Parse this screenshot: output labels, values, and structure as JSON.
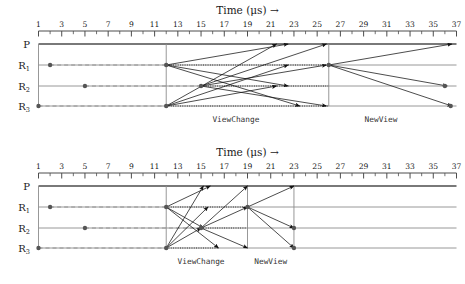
{
  "figure": {
    "axis_title": "Time (μs) →",
    "row_labels": [
      {
        "base": "P",
        "sub": ""
      },
      {
        "base": "R",
        "sub": "1"
      },
      {
        "base": "R",
        "sub": "2"
      },
      {
        "base": "R",
        "sub": "3"
      }
    ],
    "phase_labels": {
      "view_change": "ViewChange",
      "new_view": "NewView"
    },
    "colors": {
      "axis": "#4d4d4d",
      "lane": "#8c8c8c",
      "arrow": "#111111",
      "dot": "#555555",
      "dotted": "#222222",
      "text": "#1a1a1a"
    }
  },
  "chart_data": [
    {
      "type": "scatter",
      "id": "top",
      "title": "Time (μs) →",
      "xlabel": "Time (μs) →",
      "ylabel": "",
      "xlim": [
        1,
        37
      ],
      "tick_step": 1,
      "label_step": 2,
      "tick_labels": [
        1,
        3,
        5,
        7,
        9,
        11,
        13,
        15,
        17,
        19,
        21,
        23,
        25,
        27,
        29,
        31,
        33,
        35,
        37
      ],
      "lanes": [
        "P",
        "R1",
        "R2",
        "R3"
      ],
      "grid": false,
      "legend": "none",
      "annotations": [
        {
          "text": "ViewChange",
          "x": 18.0
        },
        {
          "text": "NewView",
          "x": 30.5
        }
      ],
      "events": [
        {
          "lane": "R1",
          "x": 2
        },
        {
          "lane": "R2",
          "x": 5
        },
        {
          "lane": "R3",
          "x": 1
        },
        {
          "lane": "R1",
          "x": 12
        },
        {
          "lane": "R3",
          "x": 12
        },
        {
          "lane": "R2",
          "x": 15
        },
        {
          "lane": "R1",
          "x": 26
        },
        {
          "lane": "R2",
          "x": 36
        },
        {
          "lane": "R3",
          "x": 36.5
        }
      ],
      "sync_lines": [
        {
          "x": 1,
          "from": "P",
          "to": "R3"
        },
        {
          "x": 12,
          "from": "P",
          "to": "R3"
        },
        {
          "x": 26,
          "from": "P",
          "to": "R3"
        }
      ],
      "messages": [
        {
          "from": "R1",
          "x0": 12,
          "to": "P",
          "x1": 22.5
        },
        {
          "from": "R1",
          "x0": 12,
          "to": "R2",
          "x1": 22.5
        },
        {
          "from": "R1",
          "x0": 12,
          "to": "R3",
          "x1": 23.5
        },
        {
          "from": "R3",
          "x0": 12,
          "to": "P",
          "x1": 21.5
        },
        {
          "from": "R3",
          "x0": 12,
          "to": "R1",
          "x1": 22.5
        },
        {
          "from": "R3",
          "x0": 12,
          "to": "R2",
          "x1": 21.5
        },
        {
          "from": "R2",
          "x0": 15,
          "to": "P",
          "x1": 25.8
        },
        {
          "from": "R2",
          "x0": 15,
          "to": "R1",
          "x1": 25.8
        },
        {
          "from": "R2",
          "x0": 15,
          "to": "R3",
          "x1": 25.8
        },
        {
          "from": "R1",
          "x0": 26,
          "to": "P",
          "x1": 36.6
        },
        {
          "from": "R1",
          "x0": 26,
          "to": "R2",
          "x1": 36.2
        },
        {
          "from": "R1",
          "x0": 26,
          "to": "R3",
          "x1": 36.6
        }
      ],
      "dotted_spans": [
        {
          "lane": "R1",
          "x0": 12,
          "x1": 26
        },
        {
          "lane": "R2",
          "x0": 15,
          "x1": 26
        },
        {
          "lane": "R3",
          "x0": 12,
          "x1": 26
        }
      ],
      "dashed_spans": [
        {
          "lane": "R1",
          "x0": 2,
          "x1": 12
        },
        {
          "lane": "R2",
          "x0": 5,
          "x1": 15
        },
        {
          "lane": "R3",
          "x0": 1,
          "x1": 12
        }
      ]
    },
    {
      "type": "scatter",
      "id": "bottom",
      "title": "Time (μs) →",
      "xlabel": "Time (μs) →",
      "ylabel": "",
      "xlim": [
        1,
        37
      ],
      "tick_step": 1,
      "label_step": 2,
      "tick_labels": [
        1,
        3,
        5,
        7,
        9,
        11,
        13,
        15,
        17,
        19,
        21,
        23,
        25,
        27,
        29,
        31,
        33,
        35,
        37
      ],
      "lanes": [
        "P",
        "R1",
        "R2",
        "R3"
      ],
      "grid": false,
      "legend": "none",
      "annotations": [
        {
          "text": "ViewChange",
          "x": 15.0
        },
        {
          "text": "NewView",
          "x": 21.0
        }
      ],
      "events": [
        {
          "lane": "R1",
          "x": 2
        },
        {
          "lane": "R2",
          "x": 5
        },
        {
          "lane": "R3",
          "x": 1
        },
        {
          "lane": "R1",
          "x": 12
        },
        {
          "lane": "R3",
          "x": 12
        },
        {
          "lane": "R2",
          "x": 15
        },
        {
          "lane": "R1",
          "x": 19
        },
        {
          "lane": "R2",
          "x": 23
        },
        {
          "lane": "R3",
          "x": 23
        }
      ],
      "sync_lines": [
        {
          "x": 1,
          "from": "P",
          "to": "R3"
        },
        {
          "x": 12,
          "from": "P",
          "to": "R3"
        },
        {
          "x": 19,
          "from": "P",
          "to": "R3"
        },
        {
          "x": 23,
          "from": "P",
          "to": "R3"
        }
      ],
      "messages": [
        {
          "from": "R1",
          "x0": 12,
          "to": "P",
          "x1": 15.8
        },
        {
          "from": "R1",
          "x0": 12,
          "to": "R2",
          "x1": 15.2
        },
        {
          "from": "R1",
          "x0": 12,
          "to": "R3",
          "x1": 16.5
        },
        {
          "from": "R3",
          "x0": 12,
          "to": "P",
          "x1": 15.2
        },
        {
          "from": "R3",
          "x0": 12,
          "to": "R1",
          "x1": 15.6
        },
        {
          "from": "R3",
          "x0": 12,
          "to": "R2",
          "x1": 15.0
        },
        {
          "from": "R2",
          "x0": 15,
          "to": "P",
          "x1": 19.0
        },
        {
          "from": "R2",
          "x0": 15,
          "to": "R1",
          "x1": 19.0
        },
        {
          "from": "R2",
          "x0": 15,
          "to": "R3",
          "x1": 19.0
        },
        {
          "from": "R1",
          "x0": 19,
          "to": "P",
          "x1": 23.0
        },
        {
          "from": "R1",
          "x0": 19,
          "to": "R2",
          "x1": 23.0
        },
        {
          "from": "R1",
          "x0": 19,
          "to": "R3",
          "x1": 23.0
        }
      ],
      "dotted_spans": [
        {
          "lane": "R1",
          "x0": 12,
          "x1": 19
        },
        {
          "lane": "R2",
          "x0": 15,
          "x1": 19
        },
        {
          "lane": "R3",
          "x0": 12,
          "x1": 16.5
        }
      ],
      "dashed_spans": [
        {
          "lane": "R1",
          "x0": 2,
          "x1": 12
        },
        {
          "lane": "R2",
          "x0": 5,
          "x1": 15
        },
        {
          "lane": "R3",
          "x0": 1,
          "x1": 12
        }
      ]
    }
  ]
}
